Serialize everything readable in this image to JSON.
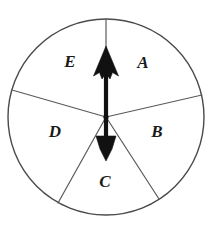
{
  "figure": {
    "name": "spinner-wheel",
    "background_color": "#ffffff",
    "outline_color": "#4a4a4a",
    "spoke_color": "#5a5a5a",
    "pointer_color": "#111111",
    "label_color": "#1a1a1a"
  },
  "wheel": {
    "center_x": 106,
    "center_y": 117,
    "radius": 98
  },
  "sectors": [
    {
      "label": "A",
      "label_x": 143,
      "label_y": 63,
      "start_angle_deg": -90,
      "end_angle_deg": -13,
      "sweep_deg": 77
    },
    {
      "label": "B",
      "label_x": 157,
      "label_y": 132,
      "start_angle_deg": -13,
      "end_angle_deg": 57,
      "sweep_deg": 70
    },
    {
      "label": "C",
      "label_x": 105,
      "label_y": 182,
      "start_angle_deg": 57,
      "end_angle_deg": 119,
      "sweep_deg": 62
    },
    {
      "label": "D",
      "label_x": 55,
      "label_y": 132,
      "start_angle_deg": 119,
      "end_angle_deg": 196,
      "sweep_deg": 77
    },
    {
      "label": "E",
      "label_x": 70,
      "label_y": 62,
      "start_angle_deg": 196,
      "end_angle_deg": 270,
      "sweep_deg": 74
    }
  ],
  "spokes": [
    {
      "name": "spoke-top",
      "x1": 106,
      "y1": 117,
      "x2": 106,
      "y2": 19
    },
    {
      "name": "spoke-upper-right",
      "x1": 106,
      "y1": 117,
      "x2": 202,
      "y2": 95
    },
    {
      "name": "spoke-lower-right",
      "x1": 106,
      "y1": 117,
      "x2": 159,
      "y2": 199
    },
    {
      "name": "spoke-lower-left",
      "x1": 106,
      "y1": 117,
      "x2": 58,
      "y2": 203
    },
    {
      "name": "spoke-upper-left",
      "x1": 106,
      "y1": 117,
      "x2": 12,
      "y2": 90
    }
  ],
  "pointer": {
    "name": "spinner-arrow",
    "direction": "up",
    "shaft_x": 106,
    "shaft_top_y": 62,
    "shaft_bottom_y": 148,
    "head_tip_y": 47,
    "tail_tip_y": 160
  }
}
